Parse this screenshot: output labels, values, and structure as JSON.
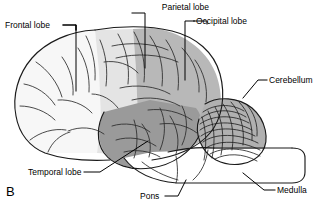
{
  "figure": {
    "panel_letter": "B",
    "background_color": "#ffffff",
    "line_color": "#1a1a1a"
  },
  "labels": {
    "frontal": "Frontal lobe",
    "parietal": "Parietal lobe",
    "occipital": "Occipital lobe",
    "cerebellum": "Cerebellum",
    "temporal": "Temporal lobe",
    "pons": "Pons",
    "medulla": "Medulla"
  },
  "regions": [
    {
      "name": "frontal-lobe",
      "label": "Frontal lobe",
      "fill": "#f7f7f7"
    },
    {
      "name": "parietal-lobe",
      "label": "Parietal lobe",
      "fill": "#e4e4e4"
    },
    {
      "name": "occipital-lobe",
      "label": "Occipital lobe",
      "fill": "#b8b8b8"
    },
    {
      "name": "temporal-lobe",
      "label": "Temporal lobe",
      "fill": "#9a9a9a"
    },
    {
      "name": "cerebellum",
      "label": "Cerebellum",
      "fill": "#b0b0b0"
    },
    {
      "name": "brainstem",
      "label": "Pons",
      "fill": "#ffffff"
    }
  ]
}
